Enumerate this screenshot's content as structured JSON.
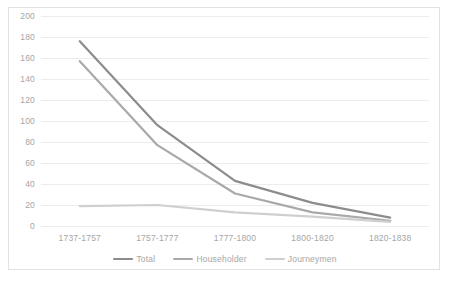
{
  "chart_data": {
    "type": "line",
    "title": "",
    "subtitle": "",
    "xlabel": "",
    "ylabel": "",
    "categories": [
      "1737-1757",
      "1757-1777",
      "1777-1800",
      "1800-1820",
      "1820-1838"
    ],
    "series": [
      {
        "name": "Total",
        "values": [
          176,
          96,
          43,
          22,
          8
        ],
        "color": "#8c8c8c"
      },
      {
        "name": "Householder",
        "values": [
          157,
          77,
          31,
          13,
          5
        ],
        "color": "#a9a9a9"
      },
      {
        "name": "Journeymen",
        "values": [
          19,
          20,
          13,
          9,
          4
        ],
        "color": "#cfcfcf"
      }
    ],
    "ylim": [
      0,
      200
    ],
    "ytick_values": [
      0,
      20,
      40,
      60,
      80,
      100,
      120,
      140,
      160,
      180,
      200
    ],
    "ytick_labels": [
      "0",
      "20",
      "40",
      "60",
      "80",
      "100",
      "120",
      "140",
      "160",
      "180",
      "200"
    ],
    "grid": true,
    "grid_axis": "y",
    "legend_position": "bottom",
    "plot_background": "#ffffff",
    "gridline_color": "#ececec",
    "tick_label_color": "#a6a6a6",
    "border_color": "#e2e2e2"
  },
  "legend": {
    "items": [
      {
        "label": "Total"
      },
      {
        "label": "Householder"
      },
      {
        "label": "Journeymen"
      }
    ]
  }
}
